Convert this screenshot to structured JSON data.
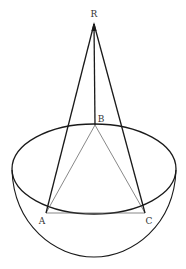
{
  "diagram": {
    "type": "geometry",
    "colors": {
      "stroke": "#1a1a1a",
      "thin_stroke": "#555555",
      "label": "#333333",
      "background": "#ffffff"
    },
    "points": {
      "R": {
        "label": "R",
        "x": 94,
        "y": 24,
        "label_x": 94,
        "label_y": 14
      },
      "B": {
        "label": "B",
        "x": 95,
        "y": 125,
        "label_x": 101,
        "label_y": 119
      },
      "A": {
        "label": "A",
        "x": 46,
        "y": 213,
        "label_x": 42,
        "label_y": 221
      },
      "C": {
        "label": "C",
        "x": 145,
        "y": 213,
        "label_x": 149,
        "label_y": 221
      }
    },
    "rim_ellipse": {
      "cx": 94,
      "cy": 169,
      "rx": 82,
      "ry": 45
    },
    "bowl_bottom_y": 257,
    "edges": [
      {
        "from": "R",
        "to": "A",
        "weight": "thick"
      },
      {
        "from": "R",
        "to": "C",
        "weight": "thick"
      },
      {
        "from": "R",
        "to": "B",
        "weight": "thick"
      },
      {
        "from": "A",
        "to": "C",
        "weight": "thin"
      },
      {
        "from": "B",
        "to": "A",
        "weight": "thin"
      },
      {
        "from": "B",
        "to": "C",
        "weight": "thin"
      }
    ]
  }
}
